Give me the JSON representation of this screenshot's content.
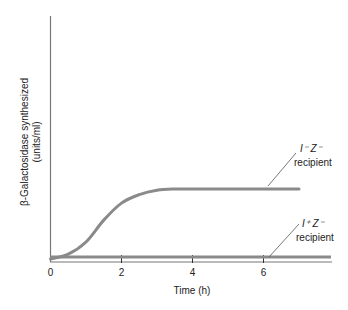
{
  "chart_data": {
    "type": "line",
    "title": "",
    "xlabel": "Time (h)",
    "ylabel_lines": [
      "β-Galactosidase synthesized",
      "(units/ml)"
    ],
    "ylabel": "β-Galactosidase synthesized (units/ml)",
    "xlim": [
      0,
      7.9
    ],
    "ylim": [
      0,
      100
    ],
    "xticks": [
      0,
      2,
      4,
      6
    ],
    "xtick_labels": [
      "0",
      "2",
      "4",
      "6"
    ],
    "yticks": [],
    "grid": false,
    "legend": "none (direct annotations)",
    "series": [
      {
        "name": "I⁻ Z⁻ recipient",
        "label_line1": "I⁻ Z⁻",
        "label_line2": "recipient",
        "x": [
          0,
          0.5,
          1.0,
          1.5,
          2.0,
          2.5,
          3.0,
          3.5,
          4.0,
          5.0,
          6.0,
          7.0
        ],
        "y": [
          0,
          2,
          7,
          16,
          23,
          26.5,
          28.3,
          28.8,
          28.8,
          28.8,
          28.8,
          28.8
        ]
      },
      {
        "name": "I⁺ Z⁻ recipient",
        "label_line1": "I⁺ Z⁻",
        "label_line2": "recipient",
        "x": [
          0,
          7.9
        ],
        "y": [
          0.8,
          0.8
        ]
      }
    ],
    "series_color": "#8a8a8a"
  }
}
